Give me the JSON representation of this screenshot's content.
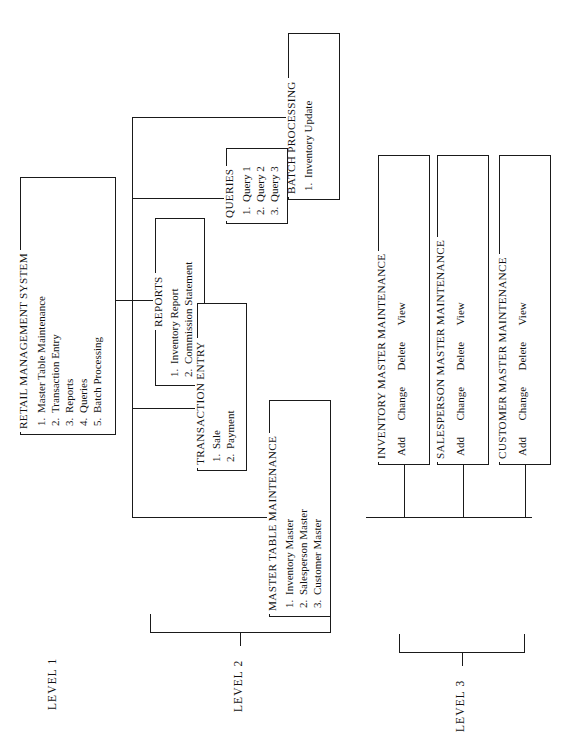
{
  "diagram": {
    "type": "menu-hierarchy-tree",
    "orientation": "rotated-90-ccw",
    "levels": [
      {
        "id": "level-1",
        "label": "LEVEL 1"
      },
      {
        "id": "level-2",
        "label": "LEVEL 2"
      },
      {
        "id": "level-3",
        "label": "LEVEL 3"
      }
    ],
    "boxes": {
      "root": {
        "title": "RETAIL MANAGEMENT SYSTEM",
        "items": [
          {
            "num": "1.",
            "label": "Master Table Maintenance"
          },
          {
            "num": "2.",
            "label": "Transaction Entry"
          },
          {
            "num": "3.",
            "label": "Reports"
          },
          {
            "num": "4.",
            "label": "Queries"
          },
          {
            "num": "5.",
            "label": "Batch Processing"
          }
        ]
      },
      "master_table_maintenance": {
        "title": "MASTER TABLE MAINTENANCE",
        "items": [
          {
            "num": "1.",
            "label": "Inventory Master"
          },
          {
            "num": "2.",
            "label": "Salesperson Master"
          },
          {
            "num": "3.",
            "label": "Customer Master"
          }
        ]
      },
      "transaction_entry": {
        "title": "TRANSACTION ENTRY",
        "items": [
          {
            "num": "1.",
            "label": "Sale"
          },
          {
            "num": "2.",
            "label": "Payment"
          }
        ]
      },
      "reports": {
        "title": "REPORTS",
        "items": [
          {
            "num": "1.",
            "label": "Inventory Report"
          },
          {
            "num": "2.",
            "label": "Commission Statement"
          }
        ]
      },
      "queries": {
        "title": "QUERIES",
        "items": [
          {
            "num": "1.",
            "label": "Query 1"
          },
          {
            "num": "2.",
            "label": "Query 2"
          },
          {
            "num": "3.",
            "label": "Query 3"
          }
        ]
      },
      "batch_processing": {
        "title": "BATCH PROCESSING",
        "items": [
          {
            "num": "1.",
            "label": "Inventory Update"
          }
        ]
      },
      "inventory_master_maintenance": {
        "title": "INVENTORY MASTER MAINTENANCE",
        "actions": "Add      Change      Delete      View",
        "action_list": [
          "Add",
          "Change",
          "Delete",
          "View"
        ]
      },
      "salesperson_master_maintenance": {
        "title": "SALESPERSON MASTER MAINTENANCE",
        "actions": "Add      Change      Delete      View",
        "action_list": [
          "Add",
          "Change",
          "Delete",
          "View"
        ]
      },
      "customer_master_maintenance": {
        "title": "CUSTOMER MASTER MAINTENANCE",
        "actions": "Add      Change      Delete      View",
        "action_list": [
          "Add",
          "Change",
          "Delete",
          "View"
        ]
      }
    },
    "colors": {
      "ink": "#1a1a1a",
      "paper": "#ffffff"
    }
  }
}
